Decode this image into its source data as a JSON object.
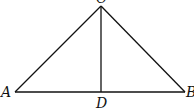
{
  "diagram": {
    "type": "geometry",
    "points": {
      "A": {
        "label": "A",
        "x": 15,
        "y": 92
      },
      "B": {
        "label": "B",
        "x": 185,
        "y": 92
      },
      "C": {
        "label": "C",
        "x": 101,
        "y": 6
      },
      "D": {
        "label": "D",
        "x": 101,
        "y": 92
      }
    },
    "segments": [
      "AB",
      "AC",
      "BC",
      "CD"
    ],
    "stroke_color": "#111111"
  }
}
